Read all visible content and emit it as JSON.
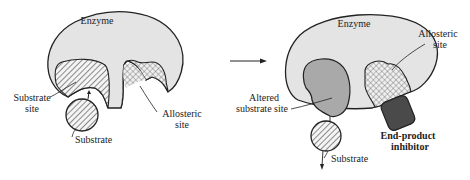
{
  "diagram": {
    "type": "allosteric-inhibition",
    "colors": {
      "enzyme_fill": "#e4e4e4",
      "outline": "#222222",
      "altered_site_fill": "#a9a9a9",
      "inhibitor_fill": "#4a4a4a",
      "hatch_stroke": "#333333"
    },
    "left_panel": {
      "enzyme_label": "Enzyme",
      "substrate_site_label_line1": "Substrate",
      "substrate_site_label_line2": "site",
      "substrate_label": "Substrate",
      "allosteric_site_label_line1": "Allosteric",
      "allosteric_site_label_line2": "site"
    },
    "arrow": {
      "icon": "right-arrow-icon"
    },
    "right_panel": {
      "enzyme_label": "Enzyme",
      "allosteric_site_label_line1": "Allosteric",
      "allosteric_site_label_line2": "site",
      "altered_site_label_line1": "Altered",
      "altered_site_label_line2": "substrate site",
      "inhibitor_label_line1": "End-product",
      "inhibitor_label_line2": "inhibitor",
      "substrate_label": "Substrate"
    }
  }
}
